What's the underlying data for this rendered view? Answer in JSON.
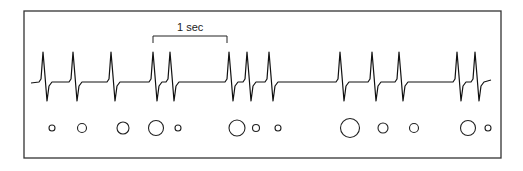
{
  "figure": {
    "scale_label": "1 sec",
    "scale_bar": {
      "x1": 153,
      "x2": 227,
      "y": 36,
      "tick": 7
    },
    "frame": {
      "x": 24,
      "y": 11,
      "w": 477,
      "h": 147
    },
    "trace": {
      "baseline_y": 82,
      "start_x": 31,
      "end_x": 491,
      "spikes_x": [
        43,
        73,
        111,
        153,
        170,
        229,
        247,
        269,
        340,
        372,
        399,
        457,
        475
      ],
      "peak_y": 52,
      "trough_y": 101
    },
    "circles": [
      {
        "x": 52,
        "r": 3
      },
      {
        "x": 82,
        "r": 4.5
      },
      {
        "x": 123,
        "r": 6
      },
      {
        "x": 156,
        "r": 7.5
      },
      {
        "x": 178,
        "r": 3
      },
      {
        "x": 237,
        "r": 8
      },
      {
        "x": 256,
        "r": 3.5
      },
      {
        "x": 278,
        "r": 3
      },
      {
        "x": 350,
        "r": 9.5
      },
      {
        "x": 383,
        "r": 5
      },
      {
        "x": 414,
        "r": 4.5
      },
      {
        "x": 468,
        "r": 7.5
      },
      {
        "x": 488,
        "r": 3
      }
    ],
    "circle_y": 128
  }
}
